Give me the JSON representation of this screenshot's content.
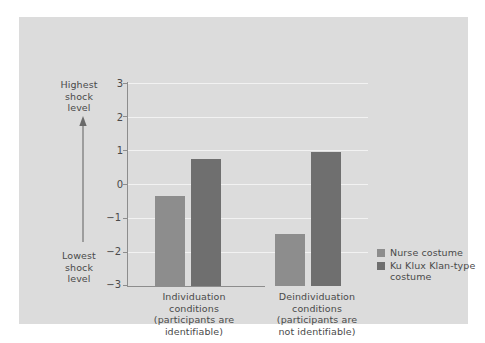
{
  "chart_data": {
    "type": "bar",
    "title": "",
    "xlabel": "",
    "ylabel": "Shock level",
    "ylim": [
      -3,
      3
    ],
    "yticks": [
      "3",
      "2",
      "1",
      "0",
      "-1",
      "-2",
      "-3"
    ],
    "ytick_values": [
      3,
      2,
      1,
      0,
      -1,
      -2,
      -3
    ],
    "grid": true,
    "legend_position": "right",
    "axis_high_caption": "Highest shock level",
    "axis_low_caption": "Lowest shock level",
    "categories": [
      "Individuation conditions (participants are identifiable)",
      "Deindividuation conditions (participants are not identifiable)"
    ],
    "series": [
      {
        "name": "Nurse costume",
        "color": "#8d8d8d",
        "values": [
          -0.35,
          -1.45
        ]
      },
      {
        "name": "Ku Klux Klan-type costume",
        "color": "#6f6f6f",
        "values": [
          0.76,
          0.95
        ]
      }
    ]
  },
  "axis": {
    "high_label_lines": [
      "Highest",
      "shock",
      "level"
    ],
    "low_label_lines": [
      "Lowest",
      "shock",
      "level"
    ],
    "high_label": "Highest shock level",
    "low_label": "Lowest shock level",
    "tick_3": "3",
    "tick_2": "2",
    "tick_1": "1",
    "tick_0": "0",
    "tick_m1": "−1",
    "tick_m2": "−2",
    "tick_m3": "−3"
  },
  "categories": [
    {
      "id": "individuation",
      "lines": [
        "Individuation",
        "conditions",
        "(participants are",
        "identifiable)"
      ],
      "full": "Individuation conditions (participants are identifiable)"
    },
    {
      "id": "deindividuation",
      "lines": [
        "Deindividuation",
        "conditions",
        "(participants are",
        "not identifiable)"
      ],
      "full": "Deindividuation conditions (participants are not identifiable)"
    }
  ],
  "legend": {
    "items": [
      {
        "label": "Nurse costume",
        "color": "#8d8d8d"
      },
      {
        "label": "Ku Klux Klan-type costume",
        "color": "#6f6f6f"
      }
    ]
  },
  "colors": {
    "panel_background": "#dcdcdc",
    "figure_background": "#ffffff",
    "axis_line": "#8d8d8d",
    "gridline": "#f2f2f2",
    "text": "#4a4a4a",
    "series_nurse": "#8d8d8d",
    "series_klan": "#6f6f6f"
  }
}
